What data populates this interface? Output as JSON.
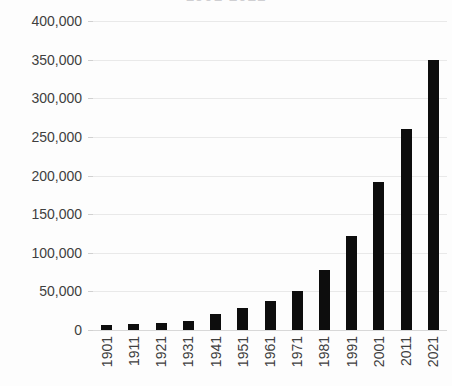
{
  "chart_data": {
    "type": "bar",
    "title": "1901-2021",
    "title_clipped": true,
    "xlabel": "",
    "ylabel": "",
    "categories": [
      "1901",
      "1911",
      "1921",
      "1931",
      "1941",
      "1951",
      "1961",
      "1971",
      "1981",
      "1991",
      "2001",
      "2011",
      "2021"
    ],
    "values": [
      7000,
      8000,
      9000,
      12000,
      21000,
      29000,
      38000,
      50000,
      78000,
      122000,
      192000,
      260000,
      350000
    ],
    "ylim": [
      0,
      400000
    ],
    "ytick_labels": [
      "400,000",
      "350,000",
      "300,000",
      "250,000",
      "200,000",
      "150,000",
      "100,000",
      "50,000",
      "0"
    ],
    "ytick_values": [
      400000,
      350000,
      300000,
      250000,
      200000,
      150000,
      100000,
      50000,
      0
    ],
    "grid": true,
    "legend": false,
    "bar_color": "#0d0d0d",
    "grid_color": "#e9e9e9",
    "background": "#fdfdfd",
    "axis_text_color": "#3f3f3f"
  }
}
